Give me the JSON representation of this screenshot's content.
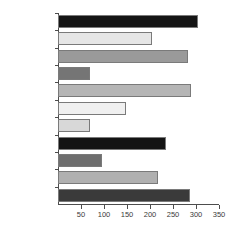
{
  "chart_data": {
    "type": "bar",
    "orientation": "horizontal",
    "title": "",
    "xlabel": "",
    "ylabel": "",
    "xlim": [
      0,
      350
    ],
    "xticks": [
      50,
      100,
      150,
      200,
      250,
      300,
      350
    ],
    "grid": false,
    "legend": false,
    "categories": [
      "Science",
      "Maths",
      "Env Ed",
      "Rel Ed",
      "Phys Ed",
      "Des Tec",
      "Music",
      "Art",
      "History",
      "Geog",
      "English"
    ],
    "values": [
      305,
      205,
      283,
      70,
      290,
      148,
      70,
      235,
      95,
      218,
      287
    ],
    "bar_colors": [
      "#151515",
      "#e6e6e6",
      "#9a9a9a",
      "#757575",
      "#b5b5b5",
      "#f0f0f0",
      "#d8d8d8",
      "#141414",
      "#6e6e6e",
      "#b0b0b0",
      "#3a3a3a"
    ],
    "bar_edge_color": "#7a7a7a",
    "axis_color": "#4d4d4d",
    "background": "#ffffff"
  }
}
